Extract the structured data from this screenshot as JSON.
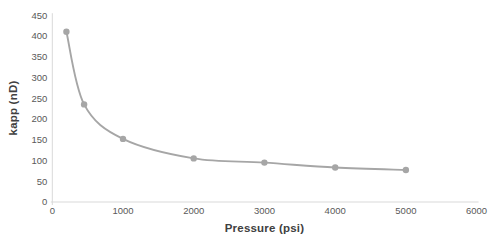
{
  "chart": {
    "background_color": "#ffffff",
    "series_color": "#a6a6a6",
    "axis_line_color": "#d9d9d9",
    "tick_label_color": "#595959",
    "axis_title_color": "#404040"
  },
  "chart_data": {
    "type": "line",
    "subtype": "scatter-smooth-line-with-markers",
    "title": "",
    "xlabel": "Pressure (psi)",
    "ylabel": "kapp (nD)",
    "x": [
      200,
      450,
      1000,
      2000,
      3000,
      4000,
      5000
    ],
    "y": [
      410,
      235,
      152,
      105,
      95,
      83,
      77
    ],
    "series": [
      {
        "name": "kapp",
        "points": [
          {
            "pressure_psi": 200,
            "kapp_nD": 410
          },
          {
            "pressure_psi": 450,
            "kapp_nD": 235
          },
          {
            "pressure_psi": 1000,
            "kapp_nD": 152
          },
          {
            "pressure_psi": 2000,
            "kapp_nD": 105
          },
          {
            "pressure_psi": 3000,
            "kapp_nD": 95
          },
          {
            "pressure_psi": 4000,
            "kapp_nD": 83
          },
          {
            "pressure_psi": 5000,
            "kapp_nD": 77
          }
        ]
      }
    ],
    "xlim": [
      0,
      6000
    ],
    "ylim": [
      0,
      450
    ],
    "x_ticks": [
      0,
      1000,
      2000,
      3000,
      4000,
      5000,
      6000
    ],
    "y_ticks": [
      0,
      50,
      100,
      150,
      200,
      250,
      300,
      350,
      400,
      450
    ],
    "grid": false,
    "legend_position": "none",
    "marker": "circle"
  }
}
